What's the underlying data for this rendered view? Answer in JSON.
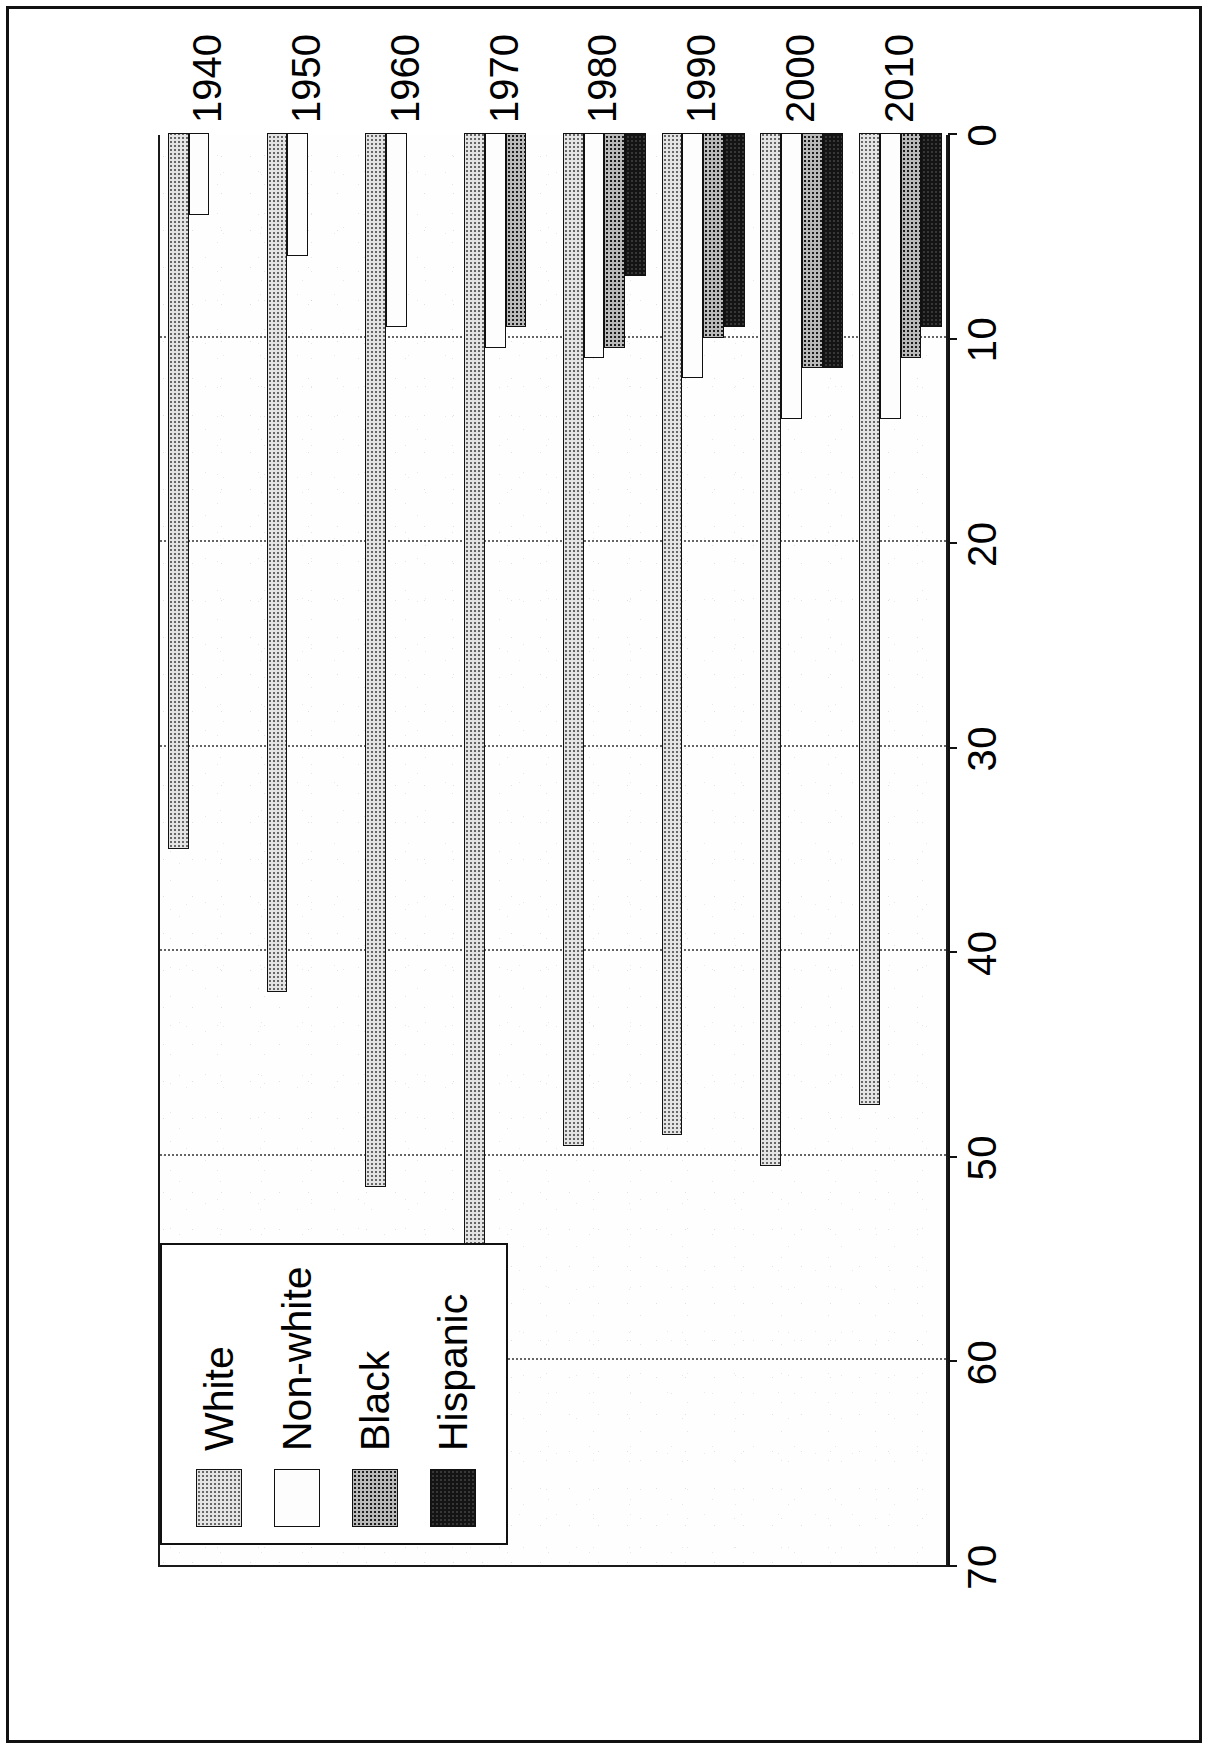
{
  "figure": {
    "orientation": "rotated-90",
    "legend": {
      "position": "inner-bottom-left",
      "entries": [
        {
          "label": "White",
          "fill": "fill-white",
          "color": "#e4e4e4"
        },
        {
          "label": "Non-white",
          "fill": "fill-nonwhite",
          "color": "#fdfdfd"
        },
        {
          "label": "Black",
          "fill": "fill-black",
          "color": "#b9b9b9"
        },
        {
          "label": "Hispanic",
          "fill": "fill-hispanic",
          "color": "#141414"
        }
      ]
    }
  },
  "chart_data": {
    "type": "bar",
    "title": "",
    "subtitle": "",
    "xlabel": "",
    "ylabel": "",
    "orientation": "horizontal",
    "grouping": "grouped",
    "categories": [
      "1940",
      "1950",
      "1960",
      "1970",
      "1980",
      "1990",
      "2000",
      "2010"
    ],
    "tick_labels": [
      "70",
      "60",
      "50",
      "40",
      "30",
      "20",
      "10",
      "0"
    ],
    "ticks": [
      70,
      60,
      50,
      40,
      30,
      20,
      10,
      0
    ],
    "ylim": [
      0,
      70
    ],
    "axis_direction": "decreasing-left-to-right",
    "grid": "dotted-vertical",
    "legend_position": "inner-bottom-left",
    "series": [
      {
        "name": "White",
        "values": [
          35.0,
          42.0,
          51.5,
          55.0,
          49.5,
          49.0,
          50.5,
          47.5
        ]
      },
      {
        "name": "Non-white",
        "values": [
          4.0,
          6.0,
          9.5,
          10.5,
          11.0,
          12.0,
          14.0,
          14.0
        ]
      },
      {
        "name": "Black",
        "values": [
          null,
          null,
          null,
          9.5,
          10.5,
          10.0,
          11.5,
          11.0
        ]
      },
      {
        "name": "Hispanic",
        "values": [
          null,
          null,
          null,
          null,
          7.0,
          9.5,
          11.5,
          9.5
        ]
      }
    ]
  }
}
